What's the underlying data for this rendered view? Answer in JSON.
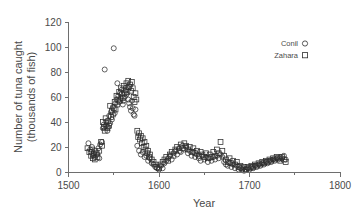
{
  "chart_data": {
    "type": "scatter",
    "title": "",
    "xlabel": "Year",
    "ylabel": "Number of tuna caught",
    "ylabel_line2": "(thousands of fish)",
    "xlim": [
      1500,
      1800
    ],
    "ylim": [
      0,
      120
    ],
    "xticks": [
      1500,
      1600,
      1700,
      1800
    ],
    "xtick_labels": [
      "1500",
      "1600",
      "1700",
      "1800"
    ],
    "xminorticks": [
      1550,
      1650,
      1750
    ],
    "yticks": [
      0,
      20,
      40,
      60,
      80,
      100,
      120
    ],
    "ytick_labels": [
      "0",
      "20",
      "40",
      "60",
      "80",
      "100",
      "120"
    ],
    "grid": false,
    "legend_position": "upper right",
    "marker_style": "open",
    "series": [
      {
        "name": "Conil",
        "marker": "circle",
        "color": "#2e2e2e",
        "points": [
          [
            1522,
            23
          ],
          [
            1524,
            18
          ],
          [
            1525,
            16
          ],
          [
            1526,
            20
          ],
          [
            1527,
            13
          ],
          [
            1528,
            15
          ],
          [
            1529,
            12
          ],
          [
            1530,
            17
          ],
          [
            1532,
            14
          ],
          [
            1533,
            19
          ],
          [
            1534,
            11
          ],
          [
            1535,
            22
          ],
          [
            1537,
            24
          ],
          [
            1538,
            35
          ],
          [
            1539,
            38
          ],
          [
            1540,
            82
          ],
          [
            1541,
            37
          ],
          [
            1542,
            40
          ],
          [
            1543,
            33
          ],
          [
            1544,
            36
          ],
          [
            1545,
            45
          ],
          [
            1546,
            39
          ],
          [
            1547,
            48
          ],
          [
            1548,
            42
          ],
          [
            1549,
            52
          ],
          [
            1550,
            99
          ],
          [
            1551,
            47
          ],
          [
            1552,
            55
          ],
          [
            1553,
            58
          ],
          [
            1554,
            71
          ],
          [
            1555,
            61
          ],
          [
            1556,
            56
          ],
          [
            1557,
            63
          ],
          [
            1558,
            59
          ],
          [
            1559,
            66
          ],
          [
            1560,
            54
          ],
          [
            1561,
            57
          ],
          [
            1562,
            60
          ],
          [
            1563,
            65
          ],
          [
            1564,
            62
          ],
          [
            1565,
            68
          ],
          [
            1566,
            58
          ],
          [
            1567,
            55
          ],
          [
            1568,
            52
          ],
          [
            1569,
            49
          ],
          [
            1570,
            57
          ],
          [
            1571,
            51
          ],
          [
            1572,
            46
          ],
          [
            1573,
            45
          ],
          [
            1574,
            50
          ],
          [
            1576,
            21
          ],
          [
            1578,
            17
          ],
          [
            1580,
            14
          ],
          [
            1582,
            16
          ],
          [
            1584,
            12
          ],
          [
            1586,
            13
          ],
          [
            1588,
            9
          ],
          [
            1590,
            11
          ],
          [
            1592,
            7
          ],
          [
            1594,
            6
          ],
          [
            1596,
            4
          ],
          [
            1598,
            3
          ],
          [
            1600,
            2
          ],
          [
            1602,
            5
          ],
          [
            1604,
            3
          ],
          [
            1606,
            7
          ],
          [
            1608,
            9
          ],
          [
            1610,
            11
          ],
          [
            1612,
            13
          ],
          [
            1614,
            10
          ],
          [
            1616,
            15
          ],
          [
            1618,
            17
          ],
          [
            1620,
            14
          ],
          [
            1622,
            19
          ],
          [
            1624,
            16
          ],
          [
            1626,
            21
          ],
          [
            1628,
            18
          ],
          [
            1630,
            20
          ],
          [
            1632,
            15
          ],
          [
            1634,
            17
          ],
          [
            1636,
            13
          ],
          [
            1638,
            16
          ],
          [
            1640,
            12
          ],
          [
            1642,
            14
          ],
          [
            1644,
            11
          ],
          [
            1646,
            9
          ],
          [
            1648,
            13
          ],
          [
            1650,
            10
          ],
          [
            1652,
            12
          ],
          [
            1654,
            8
          ],
          [
            1656,
            11
          ],
          [
            1658,
            9
          ],
          [
            1660,
            12
          ],
          [
            1662,
            10
          ],
          [
            1664,
            13
          ],
          [
            1666,
            11
          ],
          [
            1668,
            14
          ],
          [
            1670,
            12
          ],
          [
            1672,
            8
          ],
          [
            1674,
            6
          ],
          [
            1676,
            5
          ],
          [
            1678,
            7
          ],
          [
            1680,
            4
          ],
          [
            1682,
            6
          ],
          [
            1684,
            3
          ],
          [
            1686,
            5
          ],
          [
            1688,
            2
          ],
          [
            1690,
            3
          ],
          [
            1692,
            2
          ],
          [
            1694,
            1
          ],
          [
            1696,
            2
          ],
          [
            1698,
            3
          ],
          [
            1700,
            2
          ],
          [
            1702,
            4
          ],
          [
            1704,
            3
          ],
          [
            1706,
            5
          ],
          [
            1708,
            4
          ],
          [
            1710,
            6
          ],
          [
            1712,
            5
          ],
          [
            1714,
            7
          ],
          [
            1716,
            6
          ],
          [
            1718,
            8
          ],
          [
            1720,
            7
          ],
          [
            1722,
            9
          ],
          [
            1724,
            8
          ],
          [
            1726,
            10
          ],
          [
            1728,
            9
          ],
          [
            1730,
            11
          ],
          [
            1732,
            10
          ],
          [
            1734,
            12
          ],
          [
            1736,
            11
          ],
          [
            1738,
            13
          ],
          [
            1740,
            10
          ]
        ]
      },
      {
        "name": "Zahara",
        "marker": "square",
        "color": "#2e2e2e",
        "points": [
          [
            1521,
            19
          ],
          [
            1523,
            16
          ],
          [
            1525,
            13
          ],
          [
            1526,
            18
          ],
          [
            1527,
            11
          ],
          [
            1528,
            14
          ],
          [
            1529,
            10
          ],
          [
            1531,
            15
          ],
          [
            1532,
            12
          ],
          [
            1534,
            17
          ],
          [
            1536,
            24
          ],
          [
            1537,
            21
          ],
          [
            1538,
            40
          ],
          [
            1539,
            36
          ],
          [
            1540,
            33
          ],
          [
            1541,
            43
          ],
          [
            1542,
            38
          ],
          [
            1543,
            35
          ],
          [
            1544,
            41
          ],
          [
            1545,
            37
          ],
          [
            1546,
            53
          ],
          [
            1547,
            44
          ],
          [
            1548,
            49
          ],
          [
            1549,
            46
          ],
          [
            1550,
            51
          ],
          [
            1551,
            56
          ],
          [
            1552,
            50
          ],
          [
            1553,
            61
          ],
          [
            1554,
            54
          ],
          [
            1555,
            58
          ],
          [
            1556,
            64
          ],
          [
            1557,
            57
          ],
          [
            1558,
            67
          ],
          [
            1559,
            62
          ],
          [
            1560,
            59
          ],
          [
            1561,
            69
          ],
          [
            1562,
            63
          ],
          [
            1563,
            66
          ],
          [
            1564,
            71
          ],
          [
            1565,
            64
          ],
          [
            1566,
            73
          ],
          [
            1567,
            68
          ],
          [
            1568,
            70
          ],
          [
            1569,
            65
          ],
          [
            1570,
            72
          ],
          [
            1571,
            67
          ],
          [
            1572,
            60
          ],
          [
            1573,
            56
          ],
          [
            1574,
            63
          ],
          [
            1575,
            58
          ],
          [
            1576,
            33
          ],
          [
            1577,
            28
          ],
          [
            1578,
            31
          ],
          [
            1579,
            26
          ],
          [
            1580,
            29
          ],
          [
            1581,
            23
          ],
          [
            1582,
            27
          ],
          [
            1583,
            20
          ],
          [
            1584,
            24
          ],
          [
            1585,
            18
          ],
          [
            1586,
            21
          ],
          [
            1587,
            15
          ],
          [
            1588,
            17
          ],
          [
            1589,
            12
          ],
          [
            1590,
            14
          ],
          [
            1592,
            10
          ],
          [
            1594,
            8
          ],
          [
            1596,
            6
          ],
          [
            1598,
            4
          ],
          [
            1600,
            3
          ],
          [
            1602,
            6
          ],
          [
            1604,
            8
          ],
          [
            1606,
            10
          ],
          [
            1608,
            12
          ],
          [
            1610,
            9
          ],
          [
            1612,
            14
          ],
          [
            1614,
            16
          ],
          [
            1616,
            13
          ],
          [
            1618,
            18
          ],
          [
            1620,
            20
          ],
          [
            1622,
            17
          ],
          [
            1624,
            22
          ],
          [
            1626,
            19
          ],
          [
            1628,
            23
          ],
          [
            1630,
            21
          ],
          [
            1632,
            18
          ],
          [
            1634,
            20
          ],
          [
            1636,
            16
          ],
          [
            1638,
            19
          ],
          [
            1640,
            15
          ],
          [
            1642,
            17
          ],
          [
            1644,
            13
          ],
          [
            1646,
            16
          ],
          [
            1648,
            14
          ],
          [
            1650,
            12
          ],
          [
            1652,
            15
          ],
          [
            1654,
            11
          ],
          [
            1656,
            14
          ],
          [
            1658,
            12
          ],
          [
            1660,
            16
          ],
          [
            1662,
            13
          ],
          [
            1664,
            18
          ],
          [
            1666,
            15
          ],
          [
            1668,
            24
          ],
          [
            1670,
            17
          ],
          [
            1672,
            13
          ],
          [
            1674,
            10
          ],
          [
            1676,
            8
          ],
          [
            1678,
            11
          ],
          [
            1680,
            7
          ],
          [
            1682,
            9
          ],
          [
            1684,
            6
          ],
          [
            1686,
            8
          ],
          [
            1688,
            4
          ],
          [
            1690,
            5
          ],
          [
            1692,
            3
          ],
          [
            1694,
            4
          ],
          [
            1696,
            2
          ],
          [
            1698,
            4
          ],
          [
            1700,
            3
          ],
          [
            1702,
            5
          ],
          [
            1704,
            4
          ],
          [
            1706,
            6
          ],
          [
            1708,
            5
          ],
          [
            1710,
            7
          ],
          [
            1712,
            6
          ],
          [
            1714,
            8
          ],
          [
            1716,
            7
          ],
          [
            1718,
            9
          ],
          [
            1720,
            8
          ],
          [
            1722,
            10
          ],
          [
            1724,
            9
          ],
          [
            1726,
            11
          ],
          [
            1728,
            10
          ],
          [
            1730,
            12
          ],
          [
            1732,
            11
          ],
          [
            1734,
            9
          ],
          [
            1736,
            12
          ],
          [
            1738,
            10
          ],
          [
            1740,
            8
          ]
        ]
      }
    ]
  },
  "legend": {
    "entries": [
      {
        "label": "Conil",
        "marker": "circle"
      },
      {
        "label": "Zahara",
        "marker": "square"
      }
    ]
  }
}
